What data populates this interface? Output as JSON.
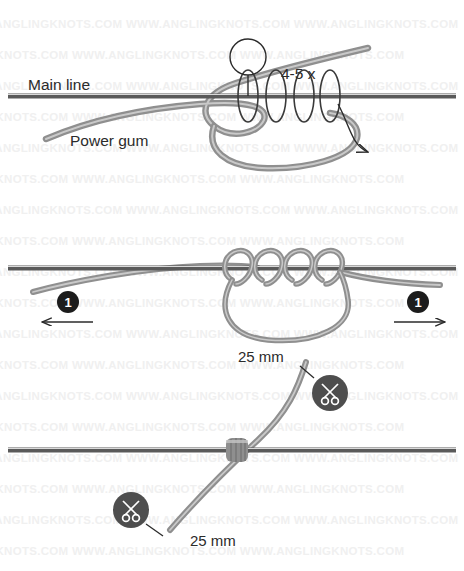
{
  "image": {
    "title": "Power Gum Stop Knot Tying Diagram",
    "width": 464,
    "height": 571,
    "background_color": "#ffffff"
  },
  "watermark": {
    "text": "WWW.ANGLINGKNOTS.COM WWW.ANGLINGKNOTS.COM WWW.ANGLINGKNOTS.COM",
    "color": "#f0f0f0",
    "rows": 18
  },
  "colors": {
    "main_line": "#5a5a5a",
    "main_line_highlight": "#d9d9d9",
    "power_gum": "#8f8f8f",
    "power_gum_highlight": "#c9c9c9",
    "wrap_stroke": "#3a3a3a",
    "badge_fill": "#1c1c1c",
    "scissors_fill": "#4e4e4e",
    "text": "#2b2b2b"
  },
  "panels": [
    {
      "id": "panel-1",
      "name": "step-1-wrapping",
      "labels": [
        {
          "name": "main-line-label",
          "text": "Main line",
          "x": 28,
          "y": 90
        },
        {
          "name": "power-gum-label",
          "text": "Power gum",
          "x": 70,
          "y": 146
        },
        {
          "name": "wrap-count-label",
          "text": "4-5 x",
          "x": 281,
          "y": 79
        }
      ],
      "callout_circle": {
        "name": "callout-marker",
        "cx": 248,
        "cy": 57,
        "r": 18
      }
    },
    {
      "id": "panel-2",
      "name": "step-2-tighten",
      "badges": [
        {
          "name": "step-badge-left",
          "text": "1",
          "cx": 68,
          "cy": 302,
          "r": 11
        },
        {
          "name": "step-badge-right",
          "text": "1",
          "cx": 418,
          "cy": 302,
          "r": 11
        }
      ],
      "arrows": [
        {
          "name": "pull-arrow-left",
          "direction": "left",
          "x1": 93,
          "y1": 322,
          "x2": 40,
          "y2": 322
        },
        {
          "name": "pull-arrow-right",
          "direction": "right",
          "x1": 394,
          "y1": 322,
          "x2": 447,
          "y2": 322
        }
      ]
    },
    {
      "id": "panel-3",
      "name": "step-3-trim",
      "labels": [
        {
          "name": "trim-length-top",
          "text": "25 mm",
          "x": 238,
          "y": 362
        },
        {
          "name": "trim-length-bottom",
          "text": "25 mm",
          "x": 190,
          "y": 546
        }
      ],
      "scissors": [
        {
          "name": "scissors-icon-top",
          "cx": 330,
          "cy": 393,
          "r": 18
        },
        {
          "name": "scissors-icon-bottom",
          "cx": 131,
          "cy": 510,
          "r": 18
        }
      ]
    }
  ],
  "icons": {
    "scissors": "scissors-icon",
    "arrow_left": "arrow-left-icon",
    "arrow_right": "arrow-right-icon",
    "callout": "callout-circle-icon"
  }
}
